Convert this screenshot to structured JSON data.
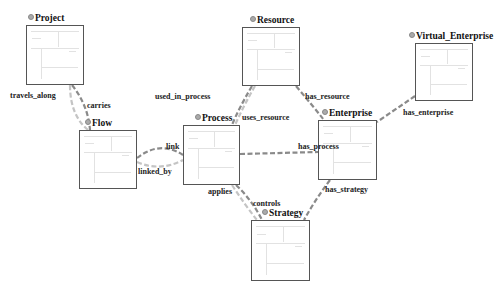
{
  "diagram": {
    "colors": {
      "node_border": "#555555",
      "edge_dark": "#8a8a8a",
      "edge_light": "#c4c4c4",
      "label": "#111111"
    },
    "nodes": [
      {
        "id": "project",
        "label": "Project",
        "x": 26,
        "y": 25,
        "w": 58,
        "h": 60,
        "lx": 28,
        "ly": 13
      },
      {
        "id": "flow",
        "label": "Flow",
        "x": 79,
        "y": 130,
        "w": 58,
        "h": 59,
        "lx": 85,
        "ly": 118
      },
      {
        "id": "process",
        "label": "Process",
        "x": 183,
        "y": 125,
        "w": 57,
        "h": 60,
        "lx": 195,
        "ly": 113
      },
      {
        "id": "resource",
        "label": "Resource",
        "x": 242,
        "y": 27,
        "w": 58,
        "h": 59,
        "lx": 250,
        "ly": 15
      },
      {
        "id": "enterprise",
        "label": "Enterprise",
        "x": 318,
        "y": 120,
        "w": 59,
        "h": 60,
        "lx": 322,
        "ly": 108
      },
      {
        "id": "strategy",
        "label": "Strategy",
        "x": 251,
        "y": 220,
        "w": 59,
        "h": 61,
        "lx": 262,
        "ly": 208
      },
      {
        "id": "virtual_enterprise",
        "label": "Virtual_Enterprise",
        "x": 415,
        "y": 43,
        "w": 58,
        "h": 58,
        "lx": 409,
        "ly": 31
      }
    ],
    "edges": [
      {
        "id": "travels_along",
        "label": "travels_along",
        "lx": 10,
        "ly": 91,
        "path": "M70 85 Q70 115 88 130",
        "style": "light"
      },
      {
        "id": "carries",
        "label": "carries",
        "lx": 87,
        "ly": 101,
        "path": "M72 85 Q88 105 90 130",
        "style": "dark"
      },
      {
        "id": "link",
        "label": "link",
        "lx": 166,
        "ly": 142,
        "path": "M137 158 Q160 140 183 155",
        "style": "dark"
      },
      {
        "id": "linked_by",
        "label": "linked_by",
        "lx": 138,
        "ly": 167,
        "path": "M137 162 Q160 172 183 160",
        "style": "light"
      },
      {
        "id": "used_in_process",
        "label": "used_in_process",
        "lx": 155,
        "ly": 92,
        "path": "M252 86 Q238 110 232 125",
        "style": "dark"
      },
      {
        "id": "uses_resource",
        "label": "uses_resource",
        "lx": 242,
        "ly": 113,
        "path": "M255 86 Q244 105 235 125",
        "style": "light"
      },
      {
        "id": "has_resource",
        "label": "has_resource",
        "lx": 305,
        "ly": 92,
        "path": "M296 86 Q312 105 324 120",
        "style": "dark"
      },
      {
        "id": "has_process",
        "label": "has_process",
        "lx": 298,
        "ly": 142,
        "path": "M240 154 L318 152",
        "style": "dark"
      },
      {
        "id": "has_enterprise",
        "label": "has_enterprise",
        "lx": 403,
        "ly": 108,
        "path": "M415 96 L377 122",
        "style": "dark"
      },
      {
        "id": "has_strategy",
        "label": "has_strategy",
        "lx": 325,
        "ly": 185,
        "path": "M330 180 Q315 200 304 220",
        "style": "dark"
      },
      {
        "id": "applies",
        "label": "applies",
        "lx": 208,
        "ly": 187,
        "path": "M232 185 Q245 205 257 220",
        "style": "light"
      },
      {
        "id": "controls",
        "label": "controls",
        "lx": 253,
        "ly": 199,
        "path": "M236 185 Q252 200 262 220",
        "style": "dark"
      }
    ]
  }
}
